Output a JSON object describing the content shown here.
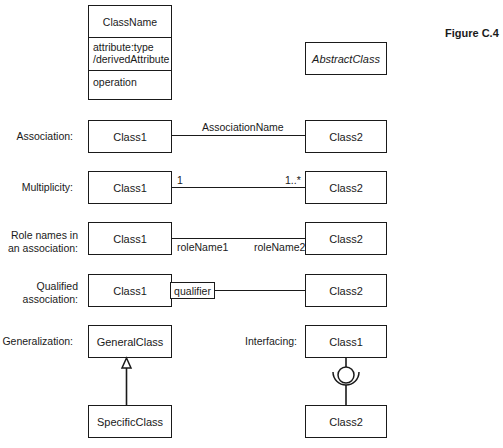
{
  "figure_label": "Figure C.4",
  "class_notation": {
    "name": "ClassName",
    "attributes": [
      "attribute:type",
      "/derivedAttribute"
    ],
    "operations": [
      "operation"
    ]
  },
  "abstract_class": {
    "name": "AbstractClass",
    "style": "italic"
  },
  "rows": {
    "association": {
      "label": "Association:",
      "left": "Class1",
      "right": "Class2",
      "association_name": "AssociationName"
    },
    "multiplicity": {
      "label": "Multiplicity:",
      "left": "Class1",
      "right": "Class2",
      "left_mult": "1",
      "right_mult": "1..*"
    },
    "role_names": {
      "label_line1": "Role names in",
      "label_line2": "an association:",
      "left": "Class1",
      "right": "Class2",
      "left_role": "roleName1",
      "right_role": "roleName2"
    },
    "qualified": {
      "label_line1": "Qualified",
      "label_line2": "association:",
      "left": "Class1",
      "right": "Class2",
      "qualifier": "qualifier"
    },
    "generalization": {
      "label": "Generalization:",
      "general": "GeneralClass",
      "specific": "SpecificClass"
    },
    "interfacing": {
      "label": "Interfacing:",
      "provider": "Class1",
      "consumer": "Class2"
    }
  }
}
